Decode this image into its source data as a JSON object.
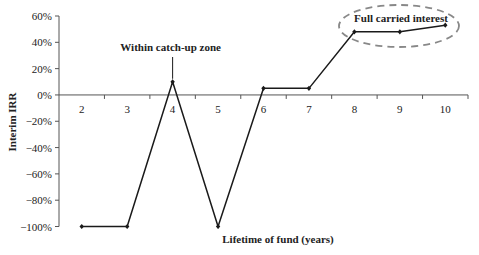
{
  "chart_data": {
    "type": "line",
    "title": "",
    "xlabel": "Lifetime of fund (years)",
    "ylabel": "Interim IRR",
    "categories": [
      "2",
      "3",
      "4",
      "5",
      "6",
      "7",
      "8",
      "9",
      "10"
    ],
    "series": [
      {
        "name": "Interim IRR",
        "values": [
          -100,
          -100,
          10,
          -100,
          5,
          5,
          48,
          48,
          53
        ]
      }
    ],
    "ylim": [
      -100,
      60
    ],
    "yticks": [
      60,
      40,
      20,
      0,
      -20,
      -40,
      -60,
      -80,
      -100
    ],
    "ytick_labels": [
      "60%",
      "40%",
      "20%",
      "0%",
      "−20%",
      "−40%",
      "−60%",
      "−80%",
      "−100%"
    ],
    "grid": false,
    "legend": null,
    "annotations": [
      {
        "text": "Within catch-up zone",
        "target_category": "4",
        "style": "leader-line"
      },
      {
        "text": "Full carried interest",
        "target_categories": [
          "8",
          "9",
          "10"
        ],
        "style": "dashed-ellipse"
      }
    ],
    "colors": {
      "line": "#1a1a1a",
      "axis": "#555555",
      "ellipse": "#888888"
    }
  }
}
